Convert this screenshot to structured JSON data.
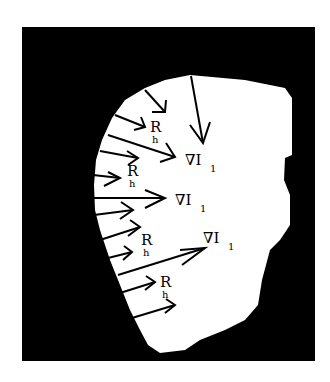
{
  "figure": {
    "background_color": "#ffffff",
    "frame_color": "#000000",
    "region_color": "#ffffff",
    "labels": {
      "gradient": [
        {
          "main": "∇I",
          "sub": "1"
        },
        {
          "main": "∇I",
          "sub": "1"
        },
        {
          "main": "∇I",
          "sub": "1"
        }
      ],
      "force": [
        {
          "main": "R",
          "sub": "h"
        },
        {
          "main": "R",
          "sub": "h"
        },
        {
          "main": "R",
          "sub": "h"
        },
        {
          "main": "R",
          "sub": "h"
        }
      ]
    }
  }
}
